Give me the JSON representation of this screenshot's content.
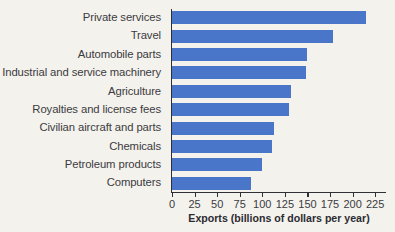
{
  "chart_data": {
    "type": "bar",
    "orientation": "horizontal",
    "title": "",
    "xlabel": "Exports (billions of dollars per year)",
    "ylabel": "",
    "xlim": [
      0,
      237
    ],
    "xticks": [
      0,
      25,
      50,
      75,
      100,
      125,
      150,
      175,
      200,
      225
    ],
    "xtick_labels": [
      "0",
      "25",
      "50",
      "75",
      "100",
      "125",
      "150",
      "175",
      "200",
      "225"
    ],
    "grid": false,
    "legend": null,
    "bar_color": "#4a76c9",
    "categories": [
      "Private services",
      "Travel",
      "Automobile parts",
      "Industrial and service machinery",
      "Agriculture",
      "Royalties and license fees",
      "Civilian aircraft and parts",
      "Chemicals",
      "Petroleum products",
      "Computers"
    ],
    "values": [
      215,
      178,
      150,
      148,
      132,
      130,
      113,
      111,
      100,
      87
    ]
  },
  "colors": {
    "background": "#f4f2ec",
    "bar": "#4a76c9",
    "axis": "#2f2f36",
    "text": "#3b3b42"
  }
}
